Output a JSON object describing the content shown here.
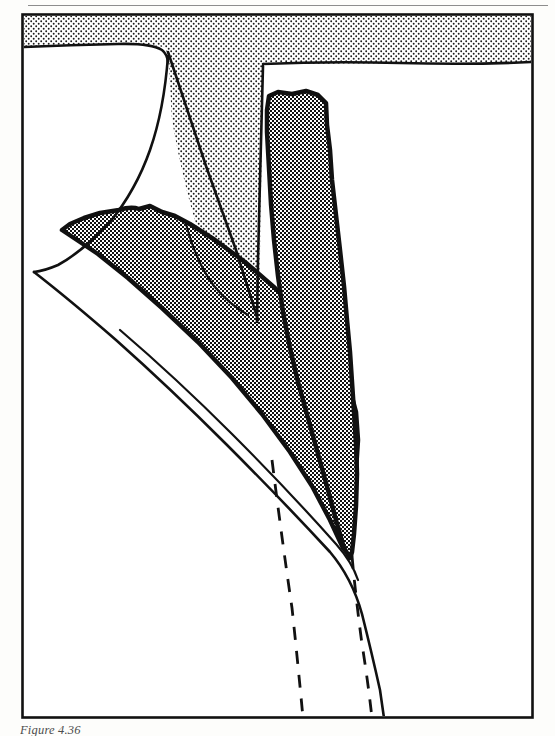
{
  "page": {
    "background_color": "#fdfdfb",
    "rule_color": "#8d8d8d"
  },
  "figure": {
    "caption": "Figure 4.36",
    "frame": {
      "x": 22,
      "y": 14,
      "width": 511,
      "height": 704
    },
    "frame_color": "#111111",
    "ink_color": "#111111",
    "colors": {
      "light_stipple": "#b9b9b9",
      "dark_stipple": "#8e8e8e",
      "band_fill": "#a8a8a8",
      "outline": "#111111",
      "white": "#ffffff"
    },
    "regions": [
      {
        "name": "upper-stippled-matrix",
        "fill_pattern": "light-stipple",
        "description": "Sparse dot stipple filling the top band and the central wedge between the two converging bands"
      },
      {
        "name": "diagonal-shaded-band",
        "fill_pattern": "dark-stipple",
        "outline": "wavy-thick",
        "description": "Left band dipping down to the right, tapering toward the convergence point"
      },
      {
        "name": "vertical-shaded-band",
        "fill_pattern": "dark-stipple",
        "outline": "wavy-thick",
        "description": "Right band descending near-vertically then narrowing to the convergence point"
      },
      {
        "name": "lower-white-matrix",
        "fill_pattern": "none",
        "description": "Unshaded region below the bands"
      }
    ],
    "lines": [
      {
        "name": "upper-boundary-curve",
        "style": "solid"
      },
      {
        "name": "inner-wedge-curve",
        "style": "solid"
      },
      {
        "name": "lower-boundary-curve",
        "style": "solid"
      },
      {
        "name": "lower-left-dashed-marker",
        "style": "dashed"
      },
      {
        "name": "lower-right-dashed-marker",
        "style": "dashed"
      }
    ]
  }
}
